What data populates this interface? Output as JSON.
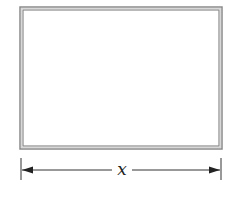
{
  "diagram": {
    "shape": "rectangle",
    "frame_color": "#8a8a8a",
    "line_color": "#333333",
    "dimension": {
      "label": "x",
      "orientation": "horizontal",
      "position": "below rectangle"
    }
  }
}
